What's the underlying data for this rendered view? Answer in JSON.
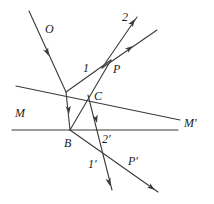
{
  "figure": {
    "type": "geometric-optics-diagram",
    "width": 214,
    "height": 204,
    "background_color": "#ffffff",
    "stroke_color": "#3a3a3a",
    "label_color": "#1a1a1a"
  },
  "labels": [
    {
      "id": "O",
      "text": "O",
      "x": 45,
      "y": 33,
      "size": 12,
      "italic": true
    },
    {
      "id": "2",
      "text": "2",
      "x": 122,
      "y": 21,
      "size": 12,
      "italic": true
    },
    {
      "id": "1",
      "text": "1",
      "x": 83,
      "y": 72,
      "size": 12,
      "italic": true
    },
    {
      "id": "P",
      "text": "P",
      "x": 113,
      "y": 73,
      "size": 12,
      "italic": true
    },
    {
      "id": "C",
      "text": "C",
      "x": 94,
      "y": 100,
      "size": 12,
      "italic": true
    },
    {
      "id": "M",
      "text": "M",
      "x": 15,
      "y": 117,
      "size": 12,
      "italic": true
    },
    {
      "id": "Mp",
      "text": "M′",
      "x": 184,
      "y": 127,
      "size": 12,
      "italic": true
    },
    {
      "id": "B",
      "text": "B",
      "x": 64,
      "y": 147,
      "size": 12,
      "italic": true
    },
    {
      "id": "2p",
      "text": "2′",
      "x": 102,
      "y": 143,
      "size": 12,
      "italic": true
    },
    {
      "id": "1p",
      "text": "1′",
      "x": 88,
      "y": 168,
      "size": 12,
      "italic": true
    },
    {
      "id": "Pp",
      "text": "P′",
      "x": 128,
      "y": 165,
      "size": 12,
      "italic": true
    }
  ],
  "lines": [
    {
      "id": "mirror-slanted-MM",
      "name": "slanted-mirror-line",
      "x1": 16,
      "y1": 86,
      "x2": 180,
      "y2": 120
    },
    {
      "id": "mirror-horizontal",
      "name": "horizontal-mirror-line",
      "x1": 12,
      "y1": 130,
      "x2": 178,
      "y2": 130
    },
    {
      "id": "incident-ray-O",
      "name": "incident-ray-O",
      "x1": 29,
      "y1": 11,
      "x2": 66,
      "y2": 92
    },
    {
      "id": "segment-O-to-B",
      "name": "ray-segment-to-B",
      "x1": 66,
      "y1": 92,
      "x2": 70,
      "y2": 130
    },
    {
      "id": "ray-B-to-P",
      "name": "ray-B-to-P",
      "x1": 70,
      "y1": 130,
      "x2": 111,
      "y2": 60
    },
    {
      "id": "ray-1-from-C-to-P",
      "name": "ray-1-to-P",
      "x1": 66,
      "y1": 92,
      "x2": 111,
      "y2": 60
    },
    {
      "id": "ray-2-upper",
      "name": "ray-2-outgoing",
      "x1": 102,
      "y1": 68,
      "x2": 137,
      "y2": 17
    },
    {
      "id": "ray-parallel-upper",
      "name": "ray-parallel-outgoing",
      "x1": 102,
      "y1": 68,
      "x2": 157,
      "y2": 30
    },
    {
      "id": "ray-C-down",
      "name": "ray-from-C-downward",
      "x1": 88,
      "y1": 95,
      "x2": 112,
      "y2": 190
    },
    {
      "id": "ray-B-down-right",
      "name": "ray-B-to-P-prime",
      "x1": 70,
      "y1": 130,
      "x2": 158,
      "y2": 192
    }
  ],
  "arrowheads": [
    {
      "id": "arrow-O",
      "name": "arrowhead-on-incident-ray-O",
      "x": 49,
      "y": 56,
      "angle": 65
    },
    {
      "id": "arrow-to-B",
      "name": "arrowhead-toward-B",
      "x": 69,
      "y": 114,
      "angle": 84
    },
    {
      "id": "arrow-ray2",
      "name": "arrowhead-on-ray-2",
      "x": 135,
      "y": 19,
      "angle": -56
    },
    {
      "id": "arrow-parallel",
      "name": "arrowhead-on-parallel-ray",
      "x": 133,
      "y": 46,
      "angle": -35
    },
    {
      "id": "arrow-C-down",
      "name": "arrowhead-below-C",
      "x": 97,
      "y": 123,
      "angle": 76
    },
    {
      "id": "arrow-1-prime",
      "name": "arrowhead-on-ray-1-prime",
      "x": 110,
      "y": 186,
      "angle": 76
    },
    {
      "id": "arrow-P-prime",
      "name": "arrowhead-on-ray-P-prime",
      "x": 155,
      "y": 190,
      "angle": 35
    }
  ]
}
